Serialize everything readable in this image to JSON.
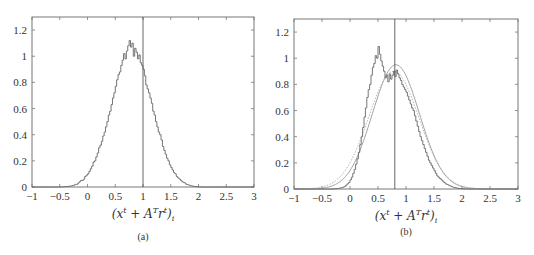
{
  "chart_data": [
    {
      "id": "a",
      "type": "histogram",
      "caption": "(a)",
      "xlabel_parts": [
        "(x",
        "t",
        " + A",
        "T",
        "r",
        "t",
        ")",
        "i"
      ],
      "xlim": [
        -1,
        3
      ],
      "ylim": [
        0,
        1.3
      ],
      "xticks": [
        -1,
        -0.5,
        0,
        0.5,
        1,
        1.5,
        2,
        2.5,
        3
      ],
      "xtick_labels": [
        "−1",
        "−0.5",
        "0",
        "0.5",
        "1",
        "1.5",
        "2",
        "2.5",
        "3"
      ],
      "yticks": [
        0,
        0.2,
        0.4,
        0.6,
        0.8,
        1,
        1.2
      ],
      "ytick_labels": [
        "0",
        "0.2",
        "0.4",
        "0.6",
        "0.8",
        "1",
        "1.2"
      ],
      "vline_x": 1.0,
      "grid": false,
      "bin_start": -0.6,
      "bin_width": 0.025,
      "bins": [
        0.0,
        0.0,
        0.0,
        0.0,
        0.0,
        0.001,
        0.001,
        0.002,
        0.003,
        0.004,
        0.005,
        0.007,
        0.008,
        0.011,
        0.014,
        0.02,
        0.02,
        0.03,
        0.04,
        0.05,
        0.05,
        0.06,
        0.08,
        0.09,
        0.1,
        0.12,
        0.14,
        0.16,
        0.19,
        0.2,
        0.23,
        0.26,
        0.3,
        0.32,
        0.35,
        0.39,
        0.42,
        0.46,
        0.5,
        0.55,
        0.58,
        0.63,
        0.68,
        0.72,
        0.77,
        0.82,
        0.86,
        0.88,
        0.93,
        0.97,
        1.02,
        0.98,
        1.04,
        1.08,
        1.12,
        1.07,
        1.1,
        1.0,
        1.06,
        1.03,
        0.98,
        1.01,
        0.95,
        0.93,
        0.9,
        0.85,
        0.78,
        0.75,
        0.72,
        0.68,
        0.64,
        0.58,
        0.55,
        0.5,
        0.46,
        0.42,
        0.4,
        0.36,
        0.31,
        0.28,
        0.25,
        0.22,
        0.2,
        0.17,
        0.15,
        0.13,
        0.11,
        0.1,
        0.08,
        0.07,
        0.06,
        0.05,
        0.04,
        0.035,
        0.03,
        0.02,
        0.018,
        0.014,
        0.01,
        0.008,
        0.006,
        0.004,
        0.003,
        0.002,
        0.001,
        0.001,
        0.0,
        0.0,
        0.0,
        0.0,
        0.0,
        0.0
      ]
    },
    {
      "id": "b",
      "type": "histogram",
      "caption": "(b)",
      "xlabel_parts": [
        "(x",
        "t",
        " + A",
        "T",
        "r",
        "t",
        ")",
        "i"
      ],
      "xlim": [
        -1,
        3
      ],
      "ylim": [
        0,
        1.3
      ],
      "xticks": [
        -1,
        -0.5,
        0,
        0.5,
        1,
        1.5,
        2,
        2.5,
        3
      ],
      "xtick_labels": [
        "−1",
        "−0.5",
        "0",
        "0.5",
        "1",
        "1.5",
        "2",
        "2.5",
        "3"
      ],
      "yticks": [
        0,
        0.2,
        0.4,
        0.6,
        0.8,
        1,
        1.2
      ],
      "ytick_labels": [
        "0",
        "0.2",
        "0.4",
        "0.6",
        "0.8",
        "1",
        "1.2"
      ],
      "vline_x": 0.8,
      "grid": false,
      "bin_start": -0.4,
      "bin_width": 0.025,
      "bins": [
        0.0,
        0.0,
        0.0,
        0.0,
        0.001,
        0.002,
        0.003,
        0.004,
        0.006,
        0.008,
        0.011,
        0.015,
        0.02,
        0.03,
        0.04,
        0.05,
        0.07,
        0.09,
        0.12,
        0.15,
        0.19,
        0.23,
        0.28,
        0.34,
        0.4,
        0.47,
        0.55,
        0.62,
        0.7,
        0.76,
        0.8,
        0.87,
        0.93,
        0.96,
        1.02,
        1.0,
        1.09,
        1.03,
        0.98,
        0.94,
        0.9,
        0.85,
        0.87,
        0.82,
        0.88,
        0.84,
        0.87,
        0.9,
        0.86,
        0.91,
        0.88,
        0.85,
        0.83,
        0.8,
        0.78,
        0.76,
        0.74,
        0.71,
        0.68,
        0.65,
        0.62,
        0.6,
        0.56,
        0.52,
        0.48,
        0.44,
        0.4,
        0.37,
        0.34,
        0.31,
        0.28,
        0.25,
        0.22,
        0.2,
        0.18,
        0.16,
        0.14,
        0.12,
        0.1,
        0.09,
        0.08,
        0.07,
        0.06,
        0.05,
        0.04,
        0.035,
        0.03,
        0.025,
        0.02,
        0.015,
        0.012,
        0.01,
        0.007,
        0.005,
        0.004,
        0.003,
        0.002,
        0.001,
        0.0,
        0.0
      ],
      "curves": [
        {
          "name": "gaussian-fit",
          "style": "solid",
          "mean": 0.82,
          "peak": 0.95,
          "sigma": 0.42
        },
        {
          "name": "gaussian-reference",
          "style": "dotted",
          "mean": 0.78,
          "peak": 0.9,
          "sigma": 0.45
        }
      ]
    }
  ]
}
